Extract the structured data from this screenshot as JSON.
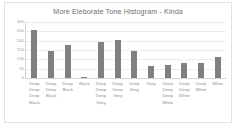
{
  "chart_data": {
    "type": "bar",
    "title": "More Eleborate Tone Histogram - Kinda",
    "xlabel": "",
    "ylabel": "",
    "ylim": [
      0,
      300
    ],
    "yticks": [
      0,
      50,
      100,
      150,
      200,
      250,
      300
    ],
    "ytick_labels": [
      "0",
      "50",
      "100",
      "150",
      "200",
      "250",
      "300"
    ],
    "grid": true,
    "legend": false,
    "bar_color": "#808080",
    "categories": [
      "Deep Deep Deep Black",
      "Deep Deep Black",
      "Deep Black",
      "Black",
      "Deep Deep Deep Grey",
      "Deep Deep Grey",
      "Deep Grey",
      "Grey",
      "Deep Deep Deep White",
      "Deep Deep White",
      "Deep White",
      "White"
    ],
    "category_lines": [
      [
        "Deep",
        "Deep",
        "Deep",
        "Black"
      ],
      [
        "Deep",
        "Deep",
        "Black"
      ],
      [
        "Deep",
        "Black"
      ],
      [
        "Black"
      ],
      [
        "Deep",
        "Deep",
        "Deep",
        "Grey"
      ],
      [
        "Deep",
        "Deep",
        "Grey"
      ],
      [
        "Deep",
        "Grey"
      ],
      [
        "Grey"
      ],
      [
        "Deep",
        "Deep",
        "Deep",
        "White"
      ],
      [
        "Deep",
        "Deep",
        "White"
      ],
      [
        "Deep",
        "White"
      ],
      [
        "White"
      ]
    ],
    "values": [
      255,
      147,
      175,
      8,
      195,
      205,
      145,
      62,
      72,
      80,
      82,
      110
    ]
  },
  "colors": {
    "bar": "#808080",
    "title_text": "#6e6e6e",
    "tick_text": "#9a9a9a",
    "category_text": "#8c8c8c",
    "gridline": "#ececec",
    "axis_line": "#d6d6d6",
    "frame_border": "#e2e2e2",
    "plot_background": "#ffffff"
  }
}
